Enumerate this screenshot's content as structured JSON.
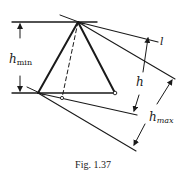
{
  "figure": {
    "caption": "Fig. 1.37",
    "labels": {
      "h_min": {
        "base": "h",
        "sub": "min"
      },
      "h": "h",
      "h_max": {
        "base": "h",
        "sub": "max"
      },
      "l": "l"
    },
    "colors": {
      "ink": "#1a1a1a",
      "background": "#ffffff"
    }
  }
}
